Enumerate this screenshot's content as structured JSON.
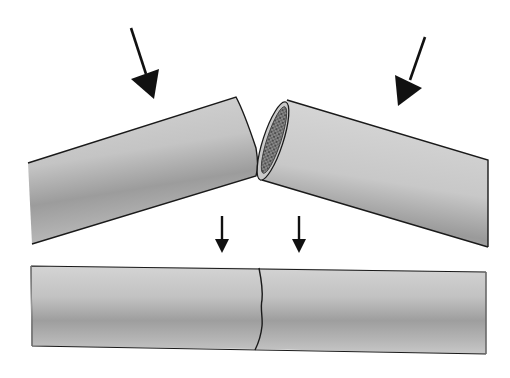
{
  "diagram": {
    "title": "",
    "colors": {
      "background": "#ffffff",
      "outline": "#1a1a1a",
      "rod_light": "#d8d8d8",
      "rod_mid": "#b4b4b4",
      "rod_dark": "#8e8e8e",
      "marrow": "#4a4a4a",
      "arrow": "#111111"
    },
    "elements": [
      {
        "id": "left-fragment",
        "label": ""
      },
      {
        "id": "right-fragment",
        "label": ""
      },
      {
        "id": "fracture-surface",
        "label": ""
      },
      {
        "id": "force-arrow-left",
        "label": ""
      },
      {
        "id": "force-arrow-right",
        "label": ""
      },
      {
        "id": "reduction-arrow-left",
        "label": ""
      },
      {
        "id": "reduction-arrow-right",
        "label": ""
      },
      {
        "id": "realigned-bone",
        "label": ""
      },
      {
        "id": "fracture-line",
        "label": ""
      }
    ]
  }
}
